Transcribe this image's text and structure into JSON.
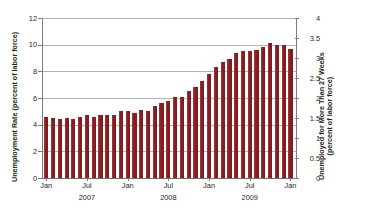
{
  "chart_data": {
    "type": "bar",
    "title": "",
    "subtitle": "",
    "xlabel": "",
    "ylabel": "Unemployment Rate (percent of labor force)",
    "y2label_line1": "Unemployed for More Than 27 Weeks",
    "y2label_line2": "(percent of labor force)",
    "ylim": [
      0,
      12
    ],
    "y2lim": [
      0,
      4
    ],
    "grid": true,
    "legend": "none",
    "yticks": [
      "0",
      "2",
      "4",
      "6",
      "8",
      "10",
      "12"
    ],
    "ytick_values": [
      0,
      2,
      4,
      6,
      8,
      10,
      12
    ],
    "y2ticks": [
      "0",
      "0.5",
      "1",
      "1.5",
      "2",
      "2.5",
      "3",
      "3.5",
      "4"
    ],
    "y2tick_values": [
      0,
      0.5,
      1,
      1.5,
      2,
      2.5,
      3,
      3.5,
      4
    ],
    "xtick_labels": [
      "Jan",
      "Jul",
      "Jan",
      "Jul",
      "Jan",
      "Jul",
      "Jan"
    ],
    "xtick_months": [
      "2007-01",
      "2007-07",
      "2008-01",
      "2008-07",
      "2009-01",
      "2009-07",
      "2010-01"
    ],
    "year_labels": [
      "2007",
      "2008",
      "2009"
    ],
    "year_positions": [
      "2007-07",
      "2008-07",
      "2009-07"
    ],
    "bar_color": "#8B1E22",
    "categories": [
      "2007-01",
      "2007-02",
      "2007-03",
      "2007-04",
      "2007-05",
      "2007-06",
      "2007-07",
      "2007-08",
      "2007-09",
      "2007-10",
      "2007-11",
      "2007-12",
      "2008-01",
      "2008-02",
      "2008-03",
      "2008-04",
      "2008-05",
      "2008-06",
      "2008-07",
      "2008-08",
      "2008-09",
      "2008-10",
      "2008-11",
      "2008-12",
      "2009-01",
      "2009-02",
      "2009-03",
      "2009-04",
      "2009-05",
      "2009-06",
      "2009-07",
      "2009-08",
      "2009-09",
      "2009-10",
      "2009-11",
      "2009-12",
      "2010-01"
    ],
    "values": [
      4.6,
      4.5,
      4.4,
      4.5,
      4.4,
      4.6,
      4.7,
      4.6,
      4.7,
      4.7,
      4.7,
      5.0,
      5.0,
      4.9,
      5.1,
      5.0,
      5.4,
      5.6,
      5.8,
      6.1,
      6.1,
      6.5,
      6.8,
      7.3,
      7.8,
      8.3,
      8.7,
      8.9,
      9.4,
      9.5,
      9.5,
      9.6,
      9.8,
      10.1,
      10.0,
      10.0,
      9.7
    ]
  }
}
